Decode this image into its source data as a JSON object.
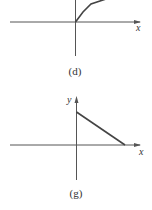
{
  "figures": [
    {
      "id": "d",
      "caption": "(d)",
      "x_label": "x",
      "y_label": "",
      "curve": "concave increasing piecewise-linear from origin"
    },
    {
      "id": "g",
      "caption": "(g)",
      "x_label": "x",
      "y_label": "y",
      "curve": "straight line decreasing from positive y-intercept to positive x-intercept"
    }
  ],
  "colors": {
    "axis": "#555555",
    "curve": "#444444",
    "text": "#333333"
  }
}
